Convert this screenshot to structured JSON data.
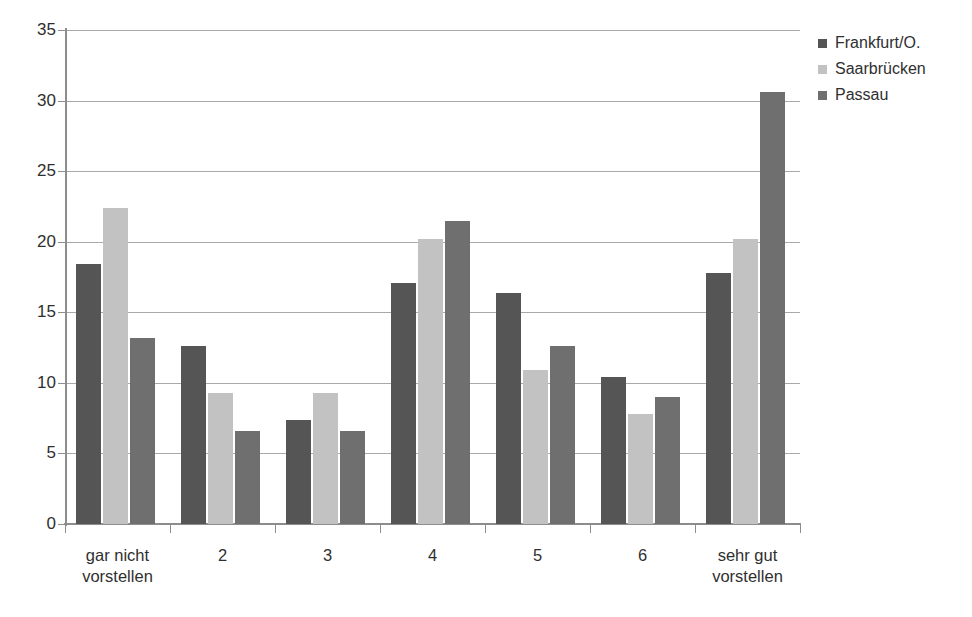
{
  "chart_data": {
    "type": "bar",
    "title": "",
    "xlabel": "",
    "ylabel": "",
    "ylim": [
      0,
      35
    ],
    "ytick_step": 5,
    "yticks": [
      35,
      30,
      25,
      20,
      15,
      10,
      5,
      0
    ],
    "grid": true,
    "legend_position": "top-right",
    "categories": [
      "gar nicht\nvorstellen",
      "2",
      "3",
      "4",
      "5",
      "6",
      "sehr gut\nvorstellen"
    ],
    "category_lines": [
      [
        "gar nicht",
        "vorstellen"
      ],
      [
        "2",
        ""
      ],
      [
        "3",
        ""
      ],
      [
        "4",
        ""
      ],
      [
        "5",
        ""
      ],
      [
        "6",
        ""
      ],
      [
        "sehr gut",
        "vorstellen"
      ]
    ],
    "series": [
      {
        "name": "Frankfurt/O.",
        "color": "#555555",
        "values": [
          18.4,
          12.6,
          7.4,
          17.1,
          16.4,
          10.4,
          17.8
        ]
      },
      {
        "name": "Saarbrücken",
        "color": "#c2c2c2",
        "values": [
          22.4,
          9.3,
          9.3,
          20.2,
          10.9,
          7.8,
          20.2
        ]
      },
      {
        "name": "Passau",
        "color": "#6f6f6f",
        "values": [
          13.2,
          6.6,
          6.6,
          21.5,
          12.6,
          9.0,
          30.6
        ]
      }
    ]
  }
}
